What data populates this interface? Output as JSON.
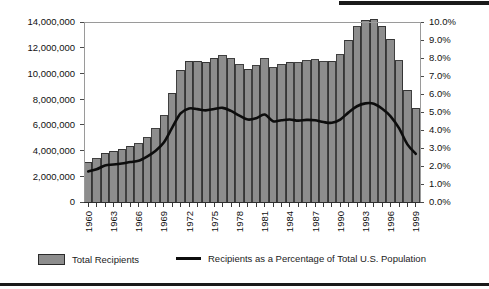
{
  "chart_data": {
    "type": "bar",
    "title": "",
    "subtitle": "",
    "xlabel": "",
    "ylabel": "",
    "y2label": "",
    "grid": false,
    "legend_position": "bottom",
    "x": [
      1960,
      1961,
      1962,
      1963,
      1964,
      1965,
      1966,
      1967,
      1968,
      1969,
      1970,
      1971,
      1972,
      1973,
      1974,
      1975,
      1976,
      1977,
      1978,
      1979,
      1980,
      1981,
      1982,
      1983,
      1984,
      1985,
      1986,
      1987,
      1988,
      1989,
      1990,
      1991,
      1992,
      1993,
      1994,
      1995,
      1996,
      1997,
      1998,
      1999
    ],
    "categories": [
      "1960",
      "1961",
      "1962",
      "1963",
      "1964",
      "1965",
      "1966",
      "1967",
      "1968",
      "1969",
      "1970",
      "1971",
      "1972",
      "1973",
      "1974",
      "1975",
      "1976",
      "1977",
      "1978",
      "1979",
      "1980",
      "1981",
      "1982",
      "1983",
      "1984",
      "1985",
      "1986",
      "1987",
      "1988",
      "1989",
      "1990",
      "1991",
      "1992",
      "1993",
      "1994",
      "1995",
      "1996",
      "1997",
      "1998",
      "1999"
    ],
    "xtick_labels": [
      "1960",
      "1963",
      "1966",
      "1969",
      "1972",
      "1975",
      "1978",
      "1981",
      "1984",
      "1987",
      "1990",
      "1993",
      "1996",
      "1999"
    ],
    "ylim": [
      0,
      14000000
    ],
    "ytick_values": [
      0,
      2000000,
      4000000,
      6000000,
      8000000,
      10000000,
      12000000,
      14000000
    ],
    "ytick_labels": [
      "0",
      "2,000,000",
      "4,000,000",
      "6,000,000",
      "8,000,000",
      "10,000,000",
      "12,000,000",
      "14,000,000"
    ],
    "y2lim": [
      0,
      10
    ],
    "y2tick_values": [
      0,
      1,
      2,
      3,
      4,
      5,
      6,
      7,
      8,
      9,
      10
    ],
    "y2tick_labels": [
      "0.0%",
      "1.0%",
      "2.0%",
      "3.0%",
      "4.0%",
      "5.0%",
      "6.0%",
      "7.0%",
      "8.0%",
      "9.0%",
      "10.0%"
    ],
    "series": [
      {
        "name": "Total Recipients",
        "type": "bar",
        "axis": "left",
        "color": "#8d8d8d",
        "edge_color": "#2b2b2b",
        "values": [
          3073000,
          3354000,
          3789000,
          3930000,
          4118000,
          4329000,
          4513000,
          5014000,
          5705000,
          6706000,
          8466000,
          10241000,
          10947000,
          10949000,
          10864000,
          11165000,
          11386000,
          11130000,
          10672000,
          10318000,
          10597000,
          11160000,
          10431000,
          10659000,
          10866000,
          10813000,
          10993000,
          11065000,
          10920000,
          10935000,
          11460000,
          12595000,
          13625000,
          14143000,
          14226000,
          13652000,
          12649000,
          10999000,
          8700000,
          7300000
        ]
      },
      {
        "name": "Recipients as a Percentage of Total U.S. Population",
        "type": "line",
        "axis": "right",
        "color": "#0d0d0d",
        "values": [
          1.7,
          1.82,
          2.03,
          2.08,
          2.14,
          2.22,
          2.29,
          2.52,
          2.83,
          3.3,
          4.13,
          4.92,
          5.2,
          5.16,
          5.09,
          5.17,
          5.23,
          5.06,
          4.8,
          4.58,
          4.65,
          4.86,
          4.49,
          4.54,
          4.58,
          4.52,
          4.56,
          4.54,
          4.44,
          4.4,
          4.58,
          4.98,
          5.32,
          5.48,
          5.46,
          5.18,
          4.76,
          4.1,
          3.2,
          2.68
        ]
      }
    ],
    "annotations": []
  },
  "legend": {
    "entries": [
      {
        "label": "Total Recipients",
        "marker": "bar-swatch"
      },
      {
        "label": "Recipients as a Percentage of Total U.S. Population",
        "marker": "line-swatch"
      }
    ]
  }
}
